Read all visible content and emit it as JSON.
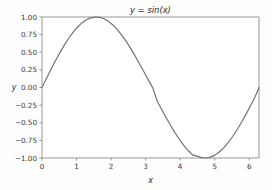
{
  "figure": {
    "background_color": "#fefefe",
    "width": 272,
    "height": 190
  },
  "chart_data": {
    "type": "line",
    "title": "y = sin(x)",
    "xlabel": "x",
    "ylabel": "y",
    "grid": false,
    "legend": null,
    "xlim": [
      0,
      6.283185307179586
    ],
    "ylim": [
      -1.0,
      1.0
    ],
    "xticks": [
      0,
      1,
      2,
      3,
      4,
      5,
      6
    ],
    "xtick_labels": [
      "0",
      "1",
      "2",
      "3",
      "4",
      "5",
      "6"
    ],
    "yticks": [
      1.0,
      0.75,
      0.5,
      0.25,
      0.0,
      -0.25,
      -0.5,
      -0.75,
      -1.0
    ],
    "ytick_labels": [
      "1.00",
      "0.75",
      "0.50",
      "0.25",
      "0.00",
      "−0.25",
      "−0.50",
      "−0.75",
      "−1.00"
    ],
    "line_color": "#6f6f6f",
    "series": [
      {
        "name": "sin(x)",
        "x": [
          0.0,
          0.1283,
          0.2566,
          0.3848,
          0.5131,
          0.6414,
          0.7697,
          0.898,
          1.0262,
          1.1545,
          1.2828,
          1.4111,
          1.5394,
          1.6676,
          1.7959,
          1.9242,
          2.0525,
          2.1808,
          2.3091,
          2.4373,
          2.5656,
          2.6939,
          2.8222,
          2.9505,
          3.0787,
          3.207,
          3.3353,
          3.4636,
          3.5919,
          3.7201,
          3.8484,
          3.9767,
          4.105,
          4.2333,
          4.3616,
          4.4898,
          4.6181,
          4.7464,
          4.8747,
          5.003,
          5.1313,
          5.2595,
          5.3878,
          5.5161,
          5.6444,
          5.7727,
          5.9009,
          6.0292,
          6.1575,
          6.2832
        ],
        "y": [
          0.0,
          0.128,
          0.2538,
          0.3753,
          0.4906,
          0.5977,
          0.6951,
          0.7813,
          0.8551,
          0.9154,
          0.9613,
          0.9874,
          0.9996,
          0.9954,
          0.9749,
          0.9385,
          0.887,
          0.8214,
          0.7431,
          0.6537,
          0.5549,
          0.4488,
          0.3375,
          0.2232,
          0.1081,
          -0.0054,
          -0.1922,
          -0.3106,
          -0.4258,
          -0.536,
          -0.6395,
          -0.7346,
          -0.8199,
          -0.894,
          -0.9557,
          -0.974,
          -0.995,
          -0.9995,
          -0.9875,
          -0.9591,
          -0.915,
          -0.856,
          -0.7833,
          -0.6981,
          -0.602,
          -0.4968,
          -0.3844,
          -0.2667,
          -0.1458,
          0.0
        ],
        "peak": {
          "x": 1.5708,
          "y": 1.0
        },
        "trough": {
          "x": 4.7124,
          "y": -1.0
        }
      }
    ]
  }
}
